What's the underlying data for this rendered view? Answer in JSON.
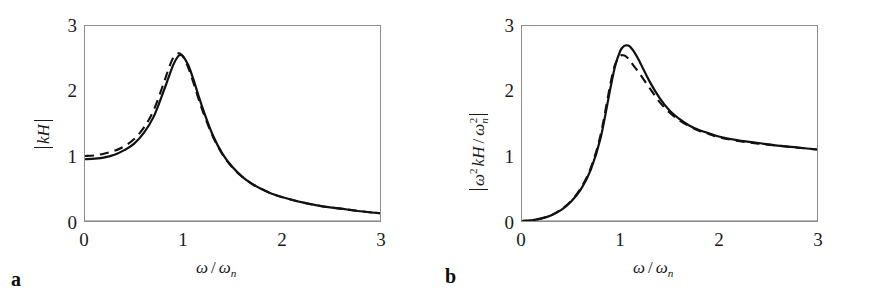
{
  "figure": {
    "background": "#ffffff",
    "frame_color": "#8d8d8d",
    "curve_color": "#111111"
  },
  "chart_data": [
    {
      "type": "line",
      "panel_label": "a",
      "title": "",
      "xlabel": "ω / ωn",
      "ylabel": "|kH|",
      "xlim": [
        0,
        3
      ],
      "ylim": [
        0,
        3
      ],
      "xticks": [
        "0",
        "1",
        "2",
        "3"
      ],
      "yticks": [
        "0",
        "1",
        "2",
        "3"
      ],
      "grid": false,
      "legend": "none",
      "x": [
        0,
        0.1,
        0.2,
        0.3,
        0.4,
        0.5,
        0.6,
        0.7,
        0.8,
        0.85,
        0.9,
        0.95,
        0.98,
        1.0,
        1.05,
        1.1,
        1.15,
        1.2,
        1.3,
        1.4,
        1.5,
        1.6,
        1.7,
        1.8,
        1.9,
        2.0,
        2.2,
        2.4,
        2.6,
        2.8,
        3.0
      ],
      "series": [
        {
          "name": "solid",
          "style": "solid",
          "values": [
            0.95,
            0.96,
            0.98,
            1.02,
            1.09,
            1.19,
            1.36,
            1.61,
            2.0,
            2.21,
            2.41,
            2.54,
            2.55,
            2.53,
            2.4,
            2.19,
            1.95,
            1.72,
            1.32,
            1.03,
            0.83,
            0.68,
            0.57,
            0.49,
            0.42,
            0.37,
            0.29,
            0.23,
            0.19,
            0.15,
            0.12
          ]
        },
        {
          "name": "dashed",
          "style": "dashed",
          "values": [
            1.0,
            1.01,
            1.04,
            1.08,
            1.15,
            1.26,
            1.44,
            1.71,
            2.12,
            2.34,
            2.52,
            2.58,
            2.56,
            2.52,
            2.36,
            2.14,
            1.9,
            1.68,
            1.3,
            1.02,
            0.82,
            0.68,
            0.57,
            0.49,
            0.42,
            0.37,
            0.29,
            0.23,
            0.19,
            0.15,
            0.12
          ]
        }
      ]
    },
    {
      "type": "line",
      "panel_label": "b",
      "title": "",
      "xlabel": "ω / ωn",
      "ylabel": "|ω² kH / ωn²|",
      "xlim": [
        0,
        3
      ],
      "ylim": [
        0,
        3
      ],
      "xticks": [
        "0",
        "1",
        "2",
        "3"
      ],
      "yticks": [
        "0",
        "1",
        "2",
        "3"
      ],
      "grid": false,
      "legend": "none",
      "x": [
        0,
        0.1,
        0.2,
        0.3,
        0.4,
        0.5,
        0.6,
        0.7,
        0.8,
        0.9,
        0.95,
        1.0,
        1.03,
        1.05,
        1.08,
        1.1,
        1.15,
        1.2,
        1.3,
        1.4,
        1.5,
        1.6,
        1.7,
        1.8,
        1.9,
        2.0,
        2.2,
        2.4,
        2.6,
        2.8,
        3.0
      ],
      "series": [
        {
          "name": "solid",
          "style": "solid",
          "values": [
            0.0,
            0.01,
            0.04,
            0.09,
            0.17,
            0.3,
            0.49,
            0.79,
            1.28,
            2.05,
            2.4,
            2.62,
            2.68,
            2.7,
            2.7,
            2.68,
            2.58,
            2.44,
            2.14,
            1.89,
            1.7,
            1.57,
            1.47,
            1.4,
            1.35,
            1.3,
            1.24,
            1.2,
            1.16,
            1.13,
            1.1
          ]
        },
        {
          "name": "dashed",
          "style": "dashed",
          "values": [
            0.0,
            0.01,
            0.04,
            0.09,
            0.18,
            0.31,
            0.51,
            0.82,
            1.33,
            2.12,
            2.42,
            2.54,
            2.55,
            2.54,
            2.5,
            2.46,
            2.36,
            2.26,
            2.04,
            1.83,
            1.67,
            1.55,
            1.46,
            1.39,
            1.34,
            1.29,
            1.23,
            1.19,
            1.16,
            1.13,
            1.1
          ]
        }
      ]
    }
  ],
  "panel_a": {
    "letter": "a",
    "xlabel_omega": "ω",
    "xlabel_slash": "/",
    "xlabel_omega_n": "ω",
    "xlabel_sub_n": "n",
    "ylabel_kH": "kH",
    "yticks": [
      "3",
      "2",
      "1",
      "0"
    ],
    "xticks": [
      "0",
      "1",
      "2",
      "3"
    ]
  },
  "panel_b": {
    "letter": "b",
    "xlabel_omega": "ω",
    "xlabel_slash": "/",
    "xlabel_omega_n": "ω",
    "xlabel_sub_n": "n",
    "ylabel_omega": "ω",
    "ylabel_sup2": "2",
    "ylabel_kH": "kH",
    "ylabel_slash": "/",
    "ylabel_omega2": "ω",
    "ylabel_sub_n": "n",
    "ylabel_sup2b": "2",
    "yticks": [
      "3",
      "2",
      "1",
      "0"
    ],
    "xticks": [
      "0",
      "1",
      "2",
      "3"
    ]
  }
}
